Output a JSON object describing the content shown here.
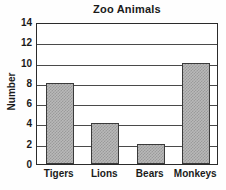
{
  "chart_data": {
    "type": "bar",
    "title": "Zoo Animals",
    "xlabel": "",
    "ylabel": "Number",
    "categories": [
      "Tigers",
      "Lions",
      "Bears",
      "Monkeys"
    ],
    "values": [
      8,
      4,
      2,
      10
    ],
    "ylim": [
      0,
      14
    ],
    "ytick_step": 2,
    "yticks": [
      0,
      2,
      4,
      6,
      8,
      10,
      12,
      14
    ],
    "ytick_labels": [
      "0",
      "2",
      "4",
      "6",
      "8",
      "10",
      "12",
      "14"
    ],
    "grid": "horizontal",
    "legend": "none",
    "bar_fill_color": "#b9b9b9",
    "bar_edge_color": "#3a3a3a",
    "axis_color": "#2b2b2b",
    "grid_color": "#4a4a4a",
    "text_color": "#1a1a1a",
    "background_color": "#fefefe"
  }
}
